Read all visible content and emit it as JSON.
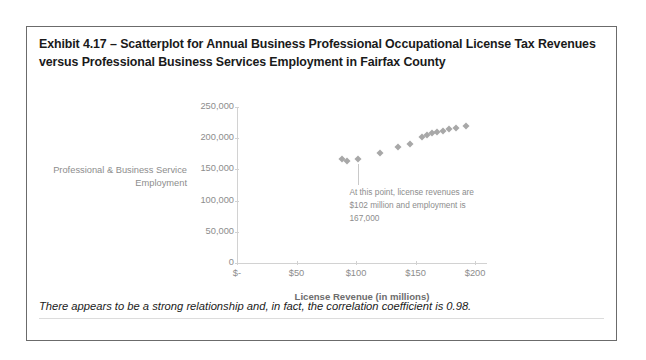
{
  "exhibit": {
    "title": "Exhibit 4.17 – Scatterplot for Annual Business Professional Occupational License Tax Revenues versus Professional Business Services Employment in Fairfax County",
    "footer_note": "There appears to be a strong relationship and, in fact, the correlation coefficient is 0.98."
  },
  "chart_data": {
    "type": "scatter",
    "title": "",
    "xlabel": "License Revenue (in millions)",
    "ylabel": "Professional & Business Service Employment",
    "xlim": [
      0,
      210
    ],
    "ylim": [
      0,
      250000
    ],
    "x_ticks": [
      0,
      50,
      100,
      150,
      200
    ],
    "x_tick_labels": [
      "$-",
      "$50",
      "$100",
      "$150",
      "$200"
    ],
    "y_ticks": [
      0,
      50000,
      100000,
      150000,
      200000,
      250000
    ],
    "y_tick_labels": [
      "0",
      "50,000",
      "100,000",
      "150,000",
      "200,000",
      "250,000"
    ],
    "grid": false,
    "legend": "none",
    "marker": "diamond",
    "marker_color": "#a8a8a8",
    "points": [
      {
        "x": 88,
        "y": 166000
      },
      {
        "x": 92,
        "y": 163000
      },
      {
        "x": 102,
        "y": 167000
      },
      {
        "x": 120,
        "y": 176000
      },
      {
        "x": 135,
        "y": 186000
      },
      {
        "x": 145,
        "y": 190000
      },
      {
        "x": 155,
        "y": 202000
      },
      {
        "x": 160,
        "y": 205000
      },
      {
        "x": 164,
        "y": 208000
      },
      {
        "x": 168,
        "y": 210000
      },
      {
        "x": 173,
        "y": 212000
      },
      {
        "x": 178,
        "y": 214000
      },
      {
        "x": 184,
        "y": 216000
      },
      {
        "x": 192,
        "y": 219000
      }
    ],
    "annotation": {
      "text": "At this point, license revenues are $102 million and employment is 167,000",
      "target_x": 102,
      "target_y": 167000
    }
  }
}
